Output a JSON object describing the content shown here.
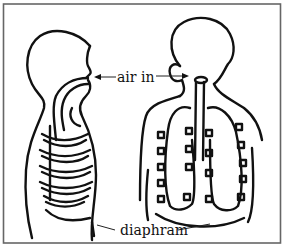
{
  "diagram": {
    "type": "anatomical line drawing",
    "panels": [
      {
        "name": "side-view",
        "description": "Side profile of head and torso showing airway and rib cage"
      },
      {
        "name": "front-view",
        "description": "Front view of head and torso showing trachea, lungs and ribs"
      }
    ],
    "labels": {
      "air_in": "air in",
      "diaphragm": "diaphram"
    },
    "colors": {
      "line": "#111111",
      "background": "#ffffff",
      "frame": "#666666"
    }
  }
}
